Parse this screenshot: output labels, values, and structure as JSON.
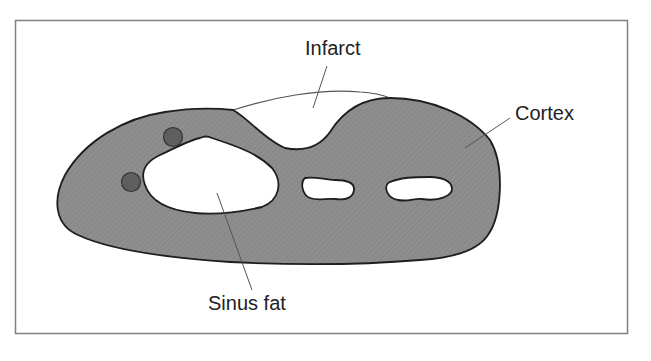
{
  "diagram": {
    "type": "anatomical-cross-section",
    "labels": {
      "infarct": "Infarct",
      "cortex": "Cortex",
      "sinus_fat": "Sinus fat"
    },
    "colors": {
      "cortex_fill": "#8c8c8c",
      "outline": "#1e1e1e",
      "vessel_fill": "#5e5e5e",
      "leader_line": "#555555",
      "frame": "#808080",
      "background": "#ffffff",
      "sinus_fill": "#ffffff"
    },
    "structures": [
      {
        "name": "cortex",
        "description": "Grey textured renal parenchyma"
      },
      {
        "name": "infarct",
        "description": "Wedge-shaped defect in the upper contour, outlined by the original renal border"
      },
      {
        "name": "sinus-fat",
        "description": "White central sinus regions"
      },
      {
        "name": "vessels",
        "count": 2,
        "description": "Dark round vessels near the hilum"
      }
    ]
  }
}
